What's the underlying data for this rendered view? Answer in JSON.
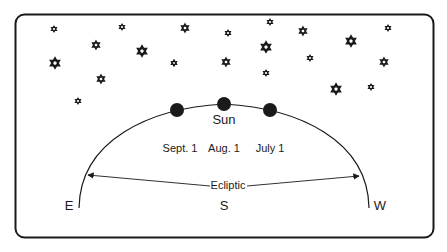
{
  "diagram": {
    "labels": {
      "sun": "Sun",
      "sept": "Sept. 1",
      "aug": "Aug. 1",
      "july": "July 1",
      "ecliptic": "Ecliptic",
      "east": "E",
      "south": "S",
      "west": "W"
    },
    "colors": {
      "ink": "#1a1a1a",
      "background": "#ffffff"
    },
    "sun_positions": [
      {
        "date": "Sept. 1",
        "x": 177,
        "y": 110
      },
      {
        "date": "Aug. 1",
        "x": 224,
        "y": 104
      },
      {
        "date": "July 1",
        "x": 270,
        "y": 110
      }
    ],
    "star_count": 24
  }
}
